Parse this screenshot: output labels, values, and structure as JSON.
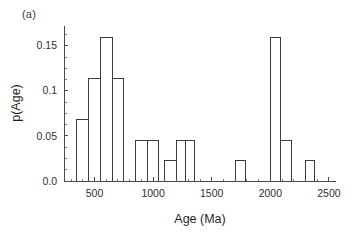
{
  "figure": {
    "panel_label": "(a)",
    "background_color": "#ffffff",
    "line_color": "#3c3c3c",
    "text_color": "#222222"
  },
  "chart_data": {
    "type": "bar",
    "title": "",
    "subtitle": "",
    "xlabel": "Age (Ma)",
    "ylabel": "p(Age)",
    "xlim": [
      240,
      2560
    ],
    "ylim": [
      0.0,
      0.172
    ],
    "grid": false,
    "legend": null,
    "annotations": [
      "(a)"
    ],
    "xticks": [
      500,
      1000,
      1500,
      2000,
      2500
    ],
    "xtick_labels": [
      "500",
      "1000",
      "1500",
      "2000",
      "2500"
    ],
    "xminor_tick_interval": 100,
    "yticks": [
      0.0,
      0.05,
      0.1,
      0.15
    ],
    "ytick_labels": [
      "0.0",
      "0.05",
      "0.1",
      "0.15"
    ],
    "yminor_tick_interval": 0.0125,
    "bin_width": 100,
    "bin_edges": [
      350,
      450,
      550,
      650,
      750,
      850,
      950,
      1050,
      1150,
      1250,
      1350,
      1700,
      1800,
      2000,
      2100,
      2200,
      2300,
      2400
    ],
    "bars": [
      {
        "x0": 350,
        "x1": 450,
        "value": 0.068
      },
      {
        "x0": 450,
        "x1": 550,
        "value": 0.114
      },
      {
        "x0": 550,
        "x1": 650,
        "value": 0.159
      },
      {
        "x0": 650,
        "x1": 750,
        "value": 0.114
      },
      {
        "x0": 850,
        "x1": 950,
        "value": 0.045
      },
      {
        "x0": 950,
        "x1": 1050,
        "value": 0.045
      },
      {
        "x0": 1100,
        "x1": 1200,
        "value": 0.023
      },
      {
        "x0": 1200,
        "x1": 1280,
        "value": 0.045
      },
      {
        "x0": 1280,
        "x1": 1350,
        "value": 0.045
      },
      {
        "x0": 1700,
        "x1": 1790,
        "value": 0.023
      },
      {
        "x0": 2000,
        "x1": 2090,
        "value": 0.159
      },
      {
        "x0": 2090,
        "x1": 2180,
        "value": 0.045
      },
      {
        "x0": 2300,
        "x1": 2380,
        "value": 0.023
      }
    ],
    "categories": [
      "400",
      "500",
      "600",
      "700",
      "900",
      "1000",
      "1150",
      "1240",
      "1315",
      "1745",
      "2045",
      "2135",
      "2340"
    ],
    "values": [
      0.068,
      0.114,
      0.159,
      0.114,
      0.045,
      0.045,
      0.023,
      0.045,
      0.045,
      0.023,
      0.159,
      0.045,
      0.023
    ]
  }
}
